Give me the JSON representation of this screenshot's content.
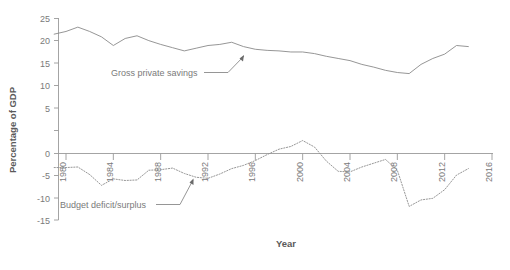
{
  "chart_data": {
    "type": "line",
    "title": "",
    "xlabel": "Year",
    "ylabel": "Percentage of GDP",
    "xlim": [
      1979,
      2016
    ],
    "ylim": [
      -15,
      25
    ],
    "xticks": [
      "1980",
      "1984",
      "1988",
      "1992",
      "1996",
      "2000",
      "2004",
      "2008",
      "2012",
      "2016"
    ],
    "yticks": [
      "25",
      "20",
      "15",
      "10",
      "5",
      "0",
      "-5",
      "-10",
      "-15"
    ],
    "grid": false,
    "legend": "none",
    "series": [
      {
        "name": "Gross private savings",
        "style": "solid",
        "color": "#8a8a8a",
        "x": [
          1979,
          1980,
          1981,
          1982,
          1983,
          1984,
          1985,
          1986,
          1987,
          1988,
          1989,
          1990,
          1991,
          1992,
          1993,
          1994,
          1995,
          1996,
          1997,
          1998,
          1999,
          2000,
          2001,
          2002,
          2003,
          2004,
          2005,
          2006,
          2007,
          2008,
          2009,
          2010,
          2011,
          2012,
          2013,
          2014
        ],
        "values": [
          22.1,
          22.6,
          23.4,
          22.6,
          21.6,
          20.0,
          21.3,
          21.8,
          20.9,
          20.2,
          19.6,
          19.0,
          19.5,
          20.0,
          20.2,
          20.6,
          19.8,
          19.3,
          19.1,
          19.0,
          18.8,
          18.8,
          18.5,
          18.0,
          17.6,
          17.2,
          16.5,
          16.0,
          15.4,
          15.0,
          14.8,
          16.5,
          17.6,
          18.4,
          20.0,
          19.8
        ]
      },
      {
        "name": "Budget deficit/surplus",
        "style": "dotted",
        "color": "#8a8a8a",
        "x": [
          1979,
          1980,
          1981,
          1982,
          1983,
          1984,
          1985,
          1986,
          1987,
          1988,
          1989,
          1990,
          1991,
          1992,
          1993,
          1994,
          1995,
          1996,
          1997,
          1998,
          1999,
          2000,
          2001,
          2002,
          2003,
          2004,
          2005,
          2006,
          2007,
          2008,
          2009,
          2010,
          2011,
          2012,
          2013,
          2014
        ],
        "values": [
          -2.6,
          -2.6,
          -2.5,
          -3.9,
          -5.9,
          -4.7,
          -5.0,
          -4.9,
          -3.1,
          -3.0,
          -2.7,
          -3.7,
          -4.4,
          -4.6,
          -3.8,
          -2.8,
          -2.2,
          -1.3,
          -0.2,
          0.8,
          1.3,
          2.4,
          1.2,
          -1.4,
          -3.3,
          -3.4,
          -2.5,
          -1.8,
          -1.1,
          -3.1,
          -9.8,
          -8.6,
          -8.3,
          -6.7,
          -4.0,
          -2.8
        ]
      }
    ],
    "annotations": [
      {
        "text": "Gross private savings",
        "series": "Gross private savings"
      },
      {
        "text": "Budget deficit/surplus",
        "series": "Budget deficit/surplus"
      }
    ]
  }
}
